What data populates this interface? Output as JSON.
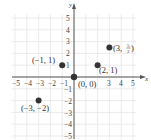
{
  "chart_data": {
    "type": "scatter",
    "title": "",
    "xlabel": "x",
    "ylabel": "y",
    "xlim": [
      -5,
      5
    ],
    "ylim": [
      -5,
      5
    ],
    "grid": true,
    "x_ticks": [
      "−5",
      "−4",
      "−3",
      "−2",
      "−1",
      "3",
      "4",
      "5"
    ],
    "y_ticks_pos": [
      "1",
      "2",
      "3",
      "4",
      "5"
    ],
    "y_ticks_neg": [
      "−1",
      "−2",
      "−3",
      "−4",
      "−5"
    ],
    "points": [
      {
        "x": -1,
        "y": 1,
        "label": "(−1, 1)"
      },
      {
        "x": 0,
        "y": 0,
        "label": "(0, 0)"
      },
      {
        "x": 2,
        "y": 1,
        "label": "(2, 1)"
      },
      {
        "x": 3,
        "y": 2.5,
        "label_main": "(3, ",
        "label_num": "5",
        "label_den": "2",
        "label_close": ")"
      },
      {
        "x": -3,
        "y": -2,
        "label": "(−3, −2)"
      }
    ]
  },
  "colors": {
    "grid": "#e6e6e6",
    "axis": "#555555",
    "point": "#333333"
  }
}
